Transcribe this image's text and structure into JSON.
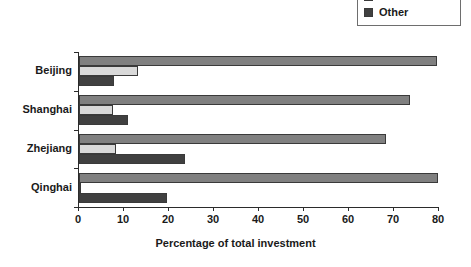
{
  "chart_data": {
    "type": "bar",
    "orientation": "horizontal",
    "title": "",
    "xlabel": "Percentage of total investment",
    "ylabel": "",
    "xlim": [
      0,
      80
    ],
    "xticks": [
      0,
      10,
      20,
      30,
      40,
      50,
      60,
      70,
      80
    ],
    "xtick_labels": [
      "0",
      "10",
      "20",
      "30",
      "40",
      "50",
      "60",
      "70",
      "80"
    ],
    "grid": false,
    "legend_position": "top-right",
    "categories": [
      "Beijing",
      "Shanghai",
      "Zhejiang",
      "Qinghai"
    ],
    "series": [
      {
        "name": "",
        "legend_clipped": true,
        "color": "#808080",
        "values": [
          79.5,
          73.5,
          68.3,
          79.8
        ]
      },
      {
        "name": "Bonds",
        "color": "#d9d9d9",
        "values": [
          13.0,
          7.5,
          8.3,
          0.5
        ]
      },
      {
        "name": "Other",
        "color": "#404040",
        "values": [
          7.8,
          10.8,
          23.5,
          19.5
        ]
      }
    ]
  },
  "legend": {
    "entries": [
      {
        "label": "Bonds",
        "color": "#d9d9d9"
      },
      {
        "label": "Other",
        "color": "#404040"
      }
    ]
  },
  "axis": {
    "x_title": "Percentage of total investment"
  },
  "colors": {
    "series_main": "#808080",
    "series_bonds": "#d9d9d9",
    "series_other": "#404040",
    "axis": "#2b2b2b",
    "bar_outline": "#3a3a3a",
    "background": "#ffffff"
  }
}
